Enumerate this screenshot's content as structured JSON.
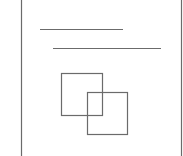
{
  "diagram": {
    "stroke_color": "#6b6b6b",
    "page": {
      "left": 21,
      "right": 181,
      "top": 0,
      "bottom": 156
    },
    "lines": [
      {
        "x1": 40,
        "y1": 29.5,
        "x2": 123,
        "y2": 29.5
      },
      {
        "x1": 53,
        "y1": 48.5,
        "x2": 161,
        "y2": 48.5
      }
    ],
    "squares": [
      {
        "x": 61.5,
        "y": 73.5,
        "w": 41,
        "h": 42
      },
      {
        "x": 87.5,
        "y": 92.5,
        "w": 40,
        "h": 42
      }
    ]
  }
}
